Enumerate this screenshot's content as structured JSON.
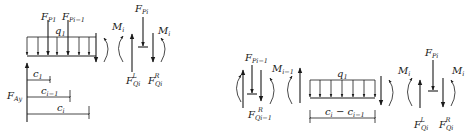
{
  "figure": {
    "left_diagram": {
      "point_loads": [
        {
          "symbol": "F",
          "subscript": "P1"
        },
        {
          "symbol": "F",
          "subscript": "Pi−1"
        },
        {
          "symbol": "F",
          "subscript": "Pi"
        }
      ],
      "distributed_load": {
        "symbol": "q",
        "subscript": "1"
      },
      "moments": [
        {
          "symbol": "M",
          "subscript": "i"
        },
        {
          "symbol": "M",
          "subscript": "i"
        }
      ],
      "shear_forces": [
        {
          "symbol": "F",
          "subscript": "Qi",
          "superscript": "L"
        },
        {
          "symbol": "F",
          "subscript": "Qi",
          "superscript": "R"
        }
      ],
      "reaction": {
        "symbol": "F",
        "subscript": "Ay"
      },
      "dimensions": [
        {
          "symbol": "c",
          "subscript": "1"
        },
        {
          "symbol": "c",
          "subscript": "i−1"
        },
        {
          "symbol": "c",
          "subscript": "i"
        }
      ]
    },
    "right_diagram": {
      "point_loads": [
        {
          "symbol": "F",
          "subscript": "Pi−1"
        },
        {
          "symbol": "F",
          "subscript": "Pi"
        }
      ],
      "distributed_load": {
        "symbol": "q",
        "subscript": "1"
      },
      "moments": [
        {
          "symbol": "M",
          "subscript": "i−1"
        },
        {
          "symbol": "M",
          "subscript": "i"
        },
        {
          "symbol": "M",
          "subscript": "i"
        }
      ],
      "shear_forces": [
        {
          "symbol": "F",
          "subscript": "Qi−1",
          "superscript": "R"
        },
        {
          "symbol": "F",
          "subscript": "Qi",
          "superscript": "L"
        },
        {
          "symbol": "F",
          "subscript": "Qi",
          "superscript": "R"
        }
      ],
      "dimension": {
        "text": "c",
        "sub_a": "i",
        "minus": " − c",
        "sub_b": "i−1"
      }
    }
  }
}
